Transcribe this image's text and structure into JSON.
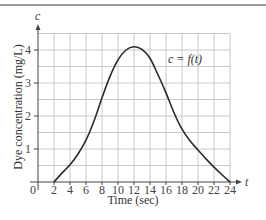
{
  "chart_data": {
    "type": "line",
    "title": "",
    "xlabel": "Time (sec)",
    "ylabel": "Dye concentration (mg/L)",
    "x_axis_variable": "t",
    "y_axis_variable": "c",
    "curve_label": "c = f(t)",
    "xlim": [
      0,
      24
    ],
    "ylim": [
      0,
      4.5
    ],
    "x_ticks": [
      0,
      2,
      4,
      6,
      8,
      10,
      12,
      14,
      16,
      18,
      20,
      22,
      24
    ],
    "y_ticks": [
      1,
      2,
      3,
      4
    ],
    "grid": true,
    "grid_x_step": 2,
    "grid_y_step": 0.5,
    "legend": "none",
    "series": [
      {
        "name": "c = f(t)",
        "x": [
          2,
          3,
          4,
          5,
          6,
          7,
          8,
          9,
          10,
          11,
          12,
          13,
          14,
          15,
          16,
          17,
          18,
          19,
          20,
          21,
          22,
          23,
          24
        ],
        "values": [
          0,
          0.27,
          0.52,
          0.85,
          1.27,
          1.85,
          2.55,
          3.2,
          3.7,
          4.0,
          4.1,
          4.02,
          3.75,
          3.25,
          2.7,
          2.1,
          1.6,
          1.25,
          0.97,
          0.7,
          0.45,
          0.22,
          0
        ]
      }
    ]
  },
  "labels": {
    "x_title": "Time (sec)",
    "y_title": "Dye concentration (mg/L)",
    "x_var": "t",
    "y_var": "c",
    "curve": "c = f(t)",
    "origin": "0"
  }
}
